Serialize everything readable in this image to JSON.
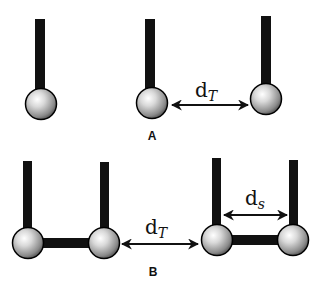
{
  "panels": [
    {
      "id": "A",
      "label": "A",
      "distance_label": {
        "base": "d",
        "subscript": "T"
      }
    },
    {
      "id": "B",
      "label": "B",
      "distance_label": {
        "base": "d",
        "subscript": "T"
      },
      "inner_distance_label": {
        "base": "d",
        "subscript": "s"
      }
    }
  ],
  "colors": {
    "stick": "#111111",
    "ball_highlight": "#ffffff",
    "ball_mid": "#c8c8c8",
    "ball_shadow": "#5a5a5a",
    "outline": "#000000",
    "text": "#111111"
  }
}
